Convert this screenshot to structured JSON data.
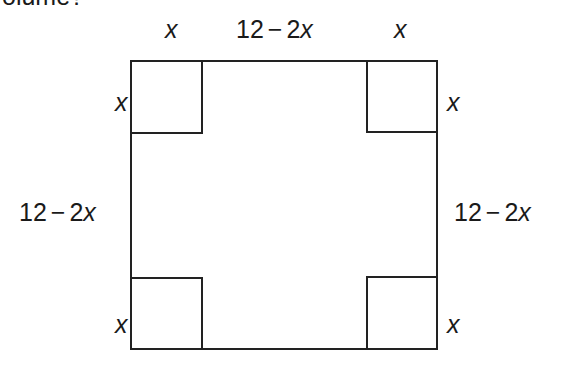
{
  "question_fragment": "olume?",
  "diagram": {
    "outer_square": {
      "left": 131,
      "top": 61,
      "right": 437,
      "bottom": 349
    },
    "corner_square_size": 71,
    "stroke_color": "#222222",
    "labels": {
      "top_left_x": {
        "var": "x"
      },
      "top_middle": {
        "num": "12",
        "minus": "−",
        "coef": "2",
        "var": "x"
      },
      "top_right_x": {
        "var": "x"
      },
      "left_top_x": {
        "var": "x"
      },
      "left_middle": {
        "num": "12",
        "minus": "−",
        "coef": "2",
        "var": "x"
      },
      "left_bottom_x": {
        "var": "x"
      },
      "right_top_x": {
        "var": "x"
      },
      "right_middle": {
        "num": "12",
        "minus": "−",
        "coef": "2",
        "var": "x"
      },
      "right_bottom_x": {
        "var": "x"
      }
    }
  }
}
